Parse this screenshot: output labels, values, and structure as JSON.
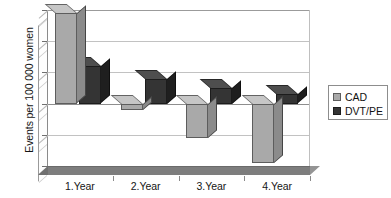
{
  "chart_data": {
    "type": "bar",
    "title": "",
    "subtitle": "",
    "xlabel": "",
    "ylabel": "Events per 100 000 women",
    "categories": [
      "1.Year",
      "2.Year",
      "3.Year",
      "4.Year"
    ],
    "series": [
      {
        "name": "CAD",
        "color": "#a9a9a9",
        "values": [
          14.5,
          -1.0,
          -5.5,
          -9.5
        ]
      },
      {
        "name": "DVT/PE",
        "color": "#343434",
        "values": [
          6.0,
          4.0,
          2.5,
          1.5
        ]
      }
    ],
    "ylim": [
      -10,
      15
    ],
    "yticks": [
      15,
      10,
      5,
      0,
      -5,
      -10
    ],
    "ytick_labels": [
      "15",
      "10",
      "5",
      "0",
      "-5",
      "-10"
    ],
    "grid": true,
    "grid_axis": "y",
    "legend_position": "right",
    "style": "3d-column",
    "zero_line": true
  },
  "axis": {
    "y_title": "Events per 100 000 women",
    "y_tick_labels": [
      "15",
      "10",
      "5",
      "0",
      "-5",
      "-10"
    ],
    "x_tick_labels": [
      "1.Year",
      "2.Year",
      "3.Year",
      "4.Year"
    ]
  },
  "legend": {
    "entries": [
      {
        "label": "CAD",
        "swatch": "#a9a9a9"
      },
      {
        "label": "DVT/PE",
        "swatch": "#343434"
      }
    ]
  }
}
